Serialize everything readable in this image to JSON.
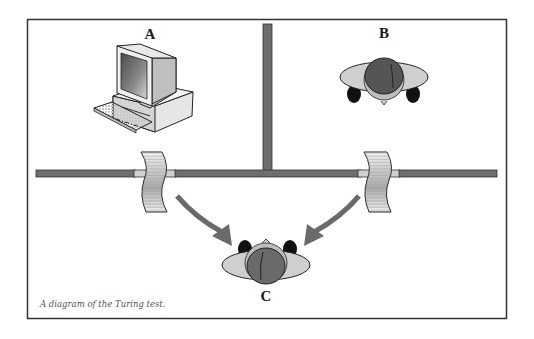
{
  "diagram": {
    "type": "turing-test-diagram",
    "labels": {
      "a": "A",
      "b": "B",
      "c": "C"
    },
    "caption": "A diagram of the Turing test.",
    "nodes": [
      {
        "id": "A",
        "depicts": "computer",
        "room": "top-left"
      },
      {
        "id": "B",
        "depicts": "human",
        "room": "top-right"
      },
      {
        "id": "C",
        "depicts": "human-interrogator",
        "room": "bottom"
      }
    ],
    "edges": [
      {
        "from": "A",
        "to": "C",
        "via": "paper-slip"
      },
      {
        "from": "B",
        "to": "C",
        "via": "paper-slip"
      }
    ],
    "colors": {
      "frame": "#333333",
      "wall": "#6e6e6e",
      "arrow": "#6a6a6a",
      "head": "#5a5a5a",
      "shoulders": "#c8c8c8",
      "hands": "#111111"
    }
  }
}
